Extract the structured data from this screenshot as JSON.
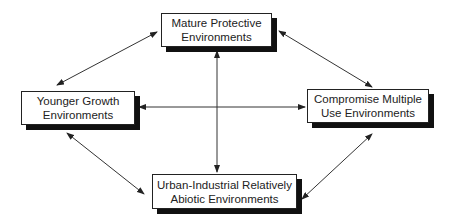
{
  "diagram": {
    "nodes": [
      {
        "id": "mature",
        "line1": "Mature Protective",
        "line2": "Environments"
      },
      {
        "id": "younger",
        "line1": "Younger Growth",
        "line2": "Environments"
      },
      {
        "id": "compromise",
        "line1": "Compromise Multiple",
        "line2": "Use Environments"
      },
      {
        "id": "urban",
        "line1": "Urban-Industrial Relatively",
        "line2": "Abiotic Environments"
      }
    ],
    "edges": [
      {
        "from": "younger",
        "to": "mature",
        "type": "bidirectional"
      },
      {
        "from": "mature",
        "to": "compromise",
        "type": "bidirectional"
      },
      {
        "from": "younger",
        "to": "urban",
        "type": "bidirectional"
      },
      {
        "from": "compromise",
        "to": "urban",
        "type": "bidirectional"
      },
      {
        "from": "mature",
        "to": "urban",
        "type": "bidirectional"
      },
      {
        "from": "younger",
        "to": "compromise",
        "type": "bidirectional"
      }
    ],
    "colors": {
      "line": "#333333",
      "shadow": "#111111",
      "box": "#ffffff"
    }
  }
}
